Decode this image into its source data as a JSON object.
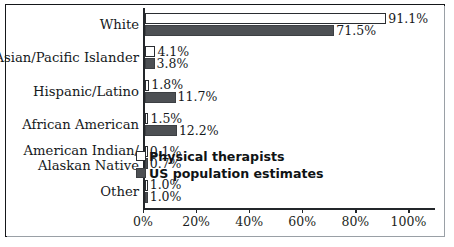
{
  "chart_data": {
    "type": "bar",
    "orientation": "horizontal",
    "title": "",
    "xlabel": "",
    "ylabel": "",
    "xlim": [
      0,
      110
    ],
    "grid": false,
    "legend_position": "inside-lower-right",
    "categories": [
      "White",
      "Asian/Pacific Islander",
      "Hispanic/Latino",
      "African American",
      "American Indian/\nAlaskan Native",
      "Other"
    ],
    "tick_labels": [
      "0%",
      "20%",
      "40%",
      "60%",
      "80%",
      "100%"
    ],
    "tick_values": [
      0,
      20,
      40,
      60,
      80,
      100
    ],
    "series": [
      {
        "name": "Physical therapists",
        "style": "light",
        "color": "#ffffff",
        "values": [
          91.1,
          4.1,
          1.8,
          1.5,
          0.1,
          1.0
        ],
        "labels": [
          "91.1%",
          "4.1%",
          "1.8%",
          "1.5%",
          "0.1%",
          "1.0%"
        ]
      },
      {
        "name": "US population estimates",
        "style": "dark",
        "color": "#4d5054",
        "values": [
          71.5,
          3.8,
          11.7,
          12.2,
          0.7,
          1.0
        ],
        "labels": [
          "71.5%",
          "3.8%",
          "11.7%",
          "12.2%",
          "0.7%",
          "1.0%"
        ]
      }
    ]
  },
  "legend": {
    "items": [
      {
        "label": "Physical therapists",
        "style": "light"
      },
      {
        "label": "US population estimates",
        "style": "dark"
      }
    ]
  }
}
